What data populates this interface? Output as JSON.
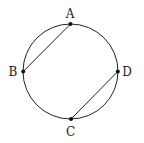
{
  "diagram": {
    "type": "circle-with-chords",
    "circle": {
      "cx": 70.5,
      "cy": 71.5,
      "r": 47.5
    },
    "stroke_color": "#222222",
    "points": [
      {
        "id": "A",
        "label": "A",
        "x": 70.5,
        "y": 24,
        "label_x": 70,
        "label_y": 18
      },
      {
        "id": "B",
        "label": "B",
        "x": 23.2,
        "y": 71.5,
        "label_x": 13,
        "label_y": 76
      },
      {
        "id": "C",
        "label": "C",
        "x": 71,
        "y": 119,
        "label_x": 70.5,
        "label_y": 136
      },
      {
        "id": "D",
        "label": "D",
        "x": 117.8,
        "y": 71.5,
        "label_x": 127,
        "label_y": 76
      }
    ],
    "chords": [
      {
        "from": "A",
        "to": "B"
      },
      {
        "from": "C",
        "to": "D"
      }
    ]
  }
}
